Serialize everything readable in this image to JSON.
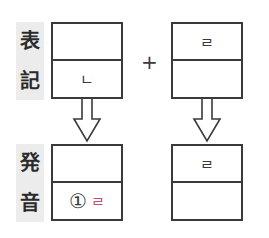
{
  "labels": {
    "spelling": [
      "表",
      "記"
    ],
    "pronunciation": [
      "発",
      "音"
    ]
  },
  "operator": "+",
  "left_top_box": {
    "top": "",
    "bottom": "ㄴ"
  },
  "right_top_box": {
    "top": "ㄹ",
    "bottom": ""
  },
  "left_bottom_box": {
    "top": "",
    "bottom_number": "①",
    "bottom": "ㄹ"
  },
  "right_bottom_box": {
    "top": "ㄹ",
    "bottom": ""
  },
  "colors": {
    "line": "#3a3a3a",
    "highlight": "#c0506e",
    "label_bg": "#ececec"
  }
}
